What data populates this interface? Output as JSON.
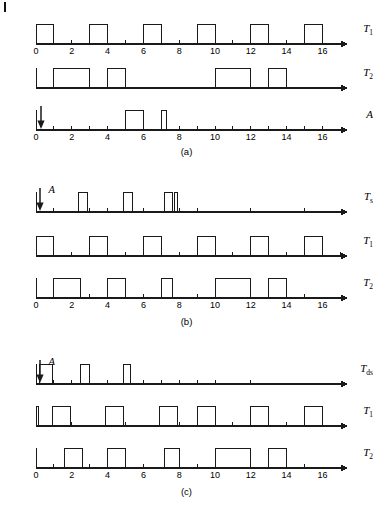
{
  "figure": {
    "type": "timing-diagram",
    "time_axis": {
      "min": 0,
      "max": 17.4,
      "tick_step": 1,
      "labeled_ticks": [
        0,
        2,
        4,
        6,
        8,
        10,
        12,
        14,
        16
      ],
      "labels": [
        "0",
        "2",
        "4",
        "6",
        "8",
        "10",
        "12",
        "14",
        "16"
      ]
    },
    "stroke_color": "#1a1a1a",
    "background": "#ffffff"
  },
  "panels": [
    {
      "id": "a",
      "caption": "(a)",
      "signals": [
        {
          "name": "T1",
          "label_main": "T",
          "label_sub": "1",
          "ticks_on_baseline": [
            1,
            2,
            3,
            4,
            5,
            6,
            7,
            8,
            9,
            10,
            11,
            12,
            13,
            14,
            15,
            16
          ],
          "pulses": [
            {
              "start": 0.0,
              "end": 1.0
            },
            {
              "start": 3.0,
              "end": 4.0
            },
            {
              "start": 6.0,
              "end": 7.0
            },
            {
              "start": 9.0,
              "end": 10.0
            },
            {
              "start": 12.0,
              "end": 13.0
            },
            {
              "start": 15.0,
              "end": 16.0
            }
          ],
          "show_axis_numbers": true,
          "arrow": null
        },
        {
          "name": "T2",
          "label_main": "T",
          "label_sub": "2",
          "ticks_on_baseline": [],
          "pulses": [
            {
              "start": 1.0,
              "end": 3.0
            },
            {
              "start": 4.0,
              "end": 5.0
            },
            {
              "start": 10.0,
              "end": 12.0
            },
            {
              "start": 13.0,
              "end": 14.0
            }
          ],
          "show_axis_numbers": false,
          "arrow": null
        },
        {
          "name": "A",
          "label_main": "A",
          "label_sub": "",
          "ticks_on_baseline": [
            1,
            2,
            3,
            4,
            8,
            9,
            10,
            11,
            12,
            13,
            14,
            15,
            16
          ],
          "pulses": [
            {
              "start": 5.0,
              "end": 6.0
            },
            {
              "start": 7.0,
              "end": 7.3
            }
          ],
          "show_axis_numbers": true,
          "arrow": {
            "time": 0.3,
            "label": ""
          }
        }
      ]
    },
    {
      "id": "b",
      "caption": "(b)",
      "signals": [
        {
          "name": "Ts",
          "label_main": "T",
          "label_sub": "s",
          "ticks_on_baseline": [
            1,
            3,
            4,
            6,
            8,
            9,
            12,
            15
          ],
          "pulses": [
            {
              "start": 2.4,
              "end": 2.9
            },
            {
              "start": 4.9,
              "end": 5.4
            },
            {
              "start": 7.2,
              "end": 7.6
            },
            {
              "start": 7.75,
              "end": 7.9
            }
          ],
          "show_axis_numbers": false,
          "arrow": {
            "time": 0.2,
            "label": "A"
          }
        },
        {
          "name": "T1",
          "label_main": "T",
          "label_sub": "1",
          "ticks_on_baseline": [
            2,
            5,
            8,
            11,
            14,
            17
          ],
          "pulses": [
            {
              "start": 0.0,
              "end": 1.0
            },
            {
              "start": 3.0,
              "end": 4.0
            },
            {
              "start": 6.0,
              "end": 7.0
            },
            {
              "start": 9.0,
              "end": 10.0
            },
            {
              "start": 12.0,
              "end": 13.0
            },
            {
              "start": 15.0,
              "end": 16.0
            }
          ],
          "show_axis_numbers": false,
          "arrow": null
        },
        {
          "name": "T2",
          "label_main": "T",
          "label_sub": "2",
          "ticks_on_baseline": [
            3,
            6,
            9,
            15
          ],
          "pulses": [
            {
              "start": 1.0,
              "end": 2.5
            },
            {
              "start": 4.0,
              "end": 5.0
            },
            {
              "start": 7.0,
              "end": 7.6
            },
            {
              "start": 10.0,
              "end": 12.0
            },
            {
              "start": 13.0,
              "end": 14.0
            }
          ],
          "show_axis_numbers": true,
          "arrow": null
        }
      ]
    },
    {
      "id": "c",
      "caption": "(c)",
      "signals": [
        {
          "name": "Tds",
          "label_main": "T",
          "label_sub": "ds",
          "ticks_on_baseline": [
            1,
            2,
            4,
            6,
            7,
            8,
            9,
            10,
            12
          ],
          "pulses": [
            {
              "start": 0.2,
              "end": 0.9
            },
            {
              "start": 2.5,
              "end": 3.0
            },
            {
              "start": 4.9,
              "end": 5.3
            }
          ],
          "show_axis_numbers": false,
          "arrow": {
            "time": 0.2,
            "label": "A"
          }
        },
        {
          "name": "T1",
          "label_main": "T",
          "label_sub": "1",
          "ticks_on_baseline": [
            2,
            5,
            8,
            11,
            14
          ],
          "pulses": [
            {
              "start": 0.0,
              "end": 0.15
            },
            {
              "start": 0.9,
              "end": 1.9
            },
            {
              "start": 3.9,
              "end": 4.9
            },
            {
              "start": 6.9,
              "end": 7.9
            },
            {
              "start": 9.0,
              "end": 10.0
            },
            {
              "start": 12.0,
              "end": 13.0
            },
            {
              "start": 15.0,
              "end": 16.0
            }
          ],
          "show_axis_numbers": false,
          "arrow": null
        },
        {
          "name": "T2",
          "label_main": "T",
          "label_sub": "2",
          "ticks_on_baseline": [
            1,
            3,
            6,
            9,
            15
          ],
          "pulses": [
            {
              "start": 1.6,
              "end": 2.6
            },
            {
              "start": 4.0,
              "end": 5.0
            },
            {
              "start": 7.2,
              "end": 8.0
            },
            {
              "start": 10.0,
              "end": 12.0
            },
            {
              "start": 13.0,
              "end": 14.0
            }
          ],
          "show_axis_numbers": true,
          "arrow": null
        }
      ]
    }
  ]
}
